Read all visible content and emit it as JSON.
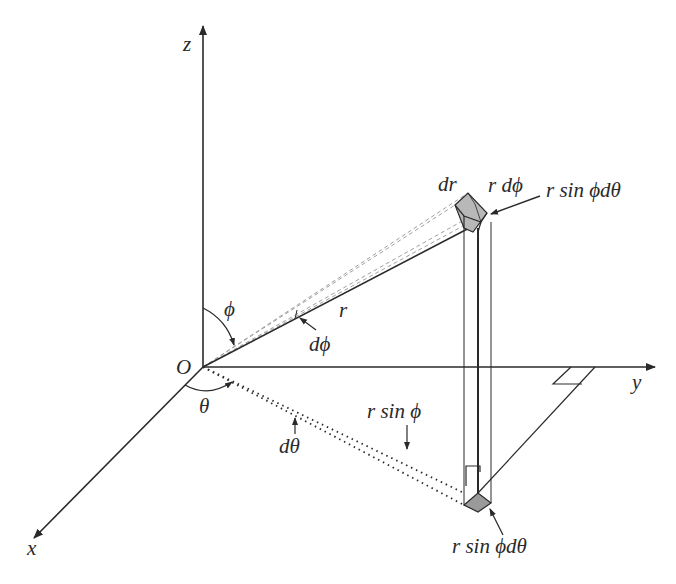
{
  "diagram": {
    "axes": {
      "x_label": "x",
      "y_label": "y",
      "z_label": "z",
      "origin_label": "O"
    },
    "angles": {
      "phi": "ϕ",
      "theta": "θ",
      "d_phi": "dϕ",
      "d_theta": "dθ"
    },
    "lengths": {
      "r": "r",
      "dr": "dr",
      "r_dphi": "r dϕ",
      "r_sin_phi": "r sin ϕ",
      "r_sin_phi_dtheta_top": "r sin ϕdθ",
      "r_sin_phi_dtheta_bottom": "r sin ϕdθ"
    },
    "colors": {
      "line": "#2a2a2a",
      "shaded_box": "#b8b8b8",
      "dashed": "#a0a0a0"
    }
  }
}
